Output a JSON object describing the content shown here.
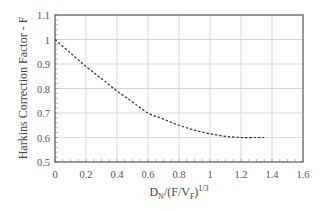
{
  "chart_data": {
    "type": "line",
    "title": "",
    "xlabel": "D_N/(F/V_F)^(1/3)",
    "xlabel_parts": {
      "base": "D",
      "sub1": "N",
      "mid": "/(F/V",
      "sub2": "F",
      "close": ")",
      "sup": "1/3"
    },
    "ylabel": "Harkins Correction Factor - F",
    "xlim": [
      0,
      1.6
    ],
    "ylim": [
      0.5,
      1.1
    ],
    "x_ticks": [
      "0",
      "0.2",
      "0.4",
      "0.6",
      "0.8",
      "1",
      "1.2",
      "1.4",
      "1.6"
    ],
    "y_ticks": [
      "0.5",
      "0.6",
      "0.7",
      "0.8",
      "0.9",
      "1",
      "1.1"
    ],
    "grid": true,
    "legend": null,
    "series": [
      {
        "name": "Harkins correction factor",
        "style": "dashed",
        "color": "#333333",
        "x": [
          0,
          0.1,
          0.2,
          0.3,
          0.4,
          0.5,
          0.6,
          0.7,
          0.8,
          0.9,
          1.0,
          1.1,
          1.2,
          1.3,
          1.35
        ],
        "y": [
          1.0,
          0.945,
          0.89,
          0.84,
          0.79,
          0.745,
          0.7,
          0.675,
          0.65,
          0.63,
          0.615,
          0.605,
          0.6,
          0.6,
          0.6
        ]
      }
    ]
  },
  "colors": {
    "grid": "#d9d9d9",
    "border": "#555555",
    "line": "#333333",
    "text": "#555555"
  }
}
